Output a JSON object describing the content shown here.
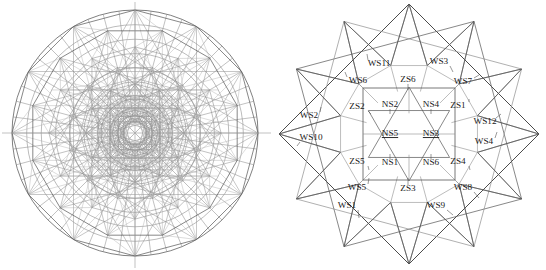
{
  "page": {
    "width": 546,
    "height": 270,
    "background": "#ffffff"
  },
  "colors": {
    "line_dark": "#2b2b2b",
    "line_mid": "#555555",
    "line_light": "#8e8e8e",
    "line_faint": "#b0b0b0",
    "axis": "#a8a8a8",
    "text": "#1a1a1a"
  },
  "left_figure": {
    "name": "polar-mesh-disk",
    "description": "Circular radial mesh with concentric rings, radial spokes, inscribed polygons and triangulation",
    "center": {
      "x": 135,
      "y": 133
    },
    "outer_radius": 123,
    "ring_count": 9,
    "spoke_count": 48,
    "axis_lines": {
      "horizontal": true,
      "vertical": true
    },
    "inscribed_polygon_sides": 12
  },
  "right_figure": {
    "name": "twelve-point-star-diagram",
    "description": "Twelve-pointed star polygon built from overlapping squares with an inner square containing a hexagram; regions labelled WS, ZS and NS",
    "center": {
      "x": 136,
      "y": 134
    },
    "outer_radius": 130,
    "star_points": 12,
    "inner_square_half": 46,
    "labels": {
      "ws": [
        {
          "text": "WS1",
          "x": 74,
          "y": 206,
          "leader": {
            "x2": 86,
            "y2": 218
          }
        },
        {
          "text": "WS2",
          "x": 36,
          "y": 116,
          "leader": {
            "x2": 48,
            "y2": 107
          }
        },
        {
          "text": "WS3",
          "x": 166,
          "y": 62,
          "leader": {
            "x2": 180,
            "y2": 72
          }
        },
        {
          "text": "WS4",
          "x": 211,
          "y": 142,
          "leader": {
            "x2": 224,
            "y2": 132
          }
        },
        {
          "text": "WS5",
          "x": 84,
          "y": 188,
          "leader": {
            "x2": 96,
            "y2": 178
          }
        },
        {
          "text": "WS6",
          "x": 85,
          "y": 81,
          "leader": {
            "x2": 72,
            "y2": 72
          }
        },
        {
          "text": "WS7",
          "x": 190,
          "y": 82,
          "leader": {
            "x2": 206,
            "y2": 75
          }
        },
        {
          "text": "WS8",
          "x": 190,
          "y": 188,
          "leader": {
            "x2": 206,
            "y2": 198
          }
        },
        {
          "text": "WS9",
          "x": 163,
          "y": 206,
          "leader": {
            "x2": 180,
            "y2": 215
          }
        },
        {
          "text": "WS10",
          "x": 38,
          "y": 138,
          "leader": {
            "x2": 24,
            "y2": 146
          }
        },
        {
          "text": "WS11",
          "x": 106,
          "y": 64,
          "leader": {
            "x2": 94,
            "y2": 54
          }
        },
        {
          "text": "WS12",
          "x": 212,
          "y": 122,
          "leader": {
            "x2": 228,
            "y2": 114
          }
        }
      ],
      "zs": [
        {
          "text": "ZS1",
          "x": 185,
          "y": 106,
          "leader": {
            "x2": 196,
            "y2": 99
          }
        },
        {
          "text": "ZS2",
          "x": 84,
          "y": 107,
          "leader": {
            "x2": 98,
            "y2": 114
          }
        },
        {
          "text": "ZS3",
          "x": 135,
          "y": 189,
          "leader": {
            "x2": 135,
            "y2": 178
          }
        },
        {
          "text": "ZS4",
          "x": 185,
          "y": 162,
          "leader": {
            "x2": 197,
            "y2": 170
          }
        },
        {
          "text": "ZS5",
          "x": 84,
          "y": 162,
          "leader": {
            "x2": 96,
            "y2": 170
          }
        },
        {
          "text": "ZS6",
          "x": 135,
          "y": 80,
          "leader": {
            "x2": 135,
            "y2": 90
          }
        }
      ],
      "ns": [
        {
          "text": "NS1",
          "x": 117,
          "y": 163,
          "underline": false,
          "leader": {
            "x2": 117,
            "y2": 154
          }
        },
        {
          "text": "NS2",
          "x": 117,
          "y": 105,
          "underline": false,
          "leader": {
            "x2": 117,
            "y2": 114
          }
        },
        {
          "text": "NS3",
          "x": 158,
          "y": 134,
          "underline": true,
          "leader": null
        },
        {
          "text": "NS4",
          "x": 158,
          "y": 105,
          "underline": false,
          "leader": {
            "x2": 158,
            "y2": 114
          }
        },
        {
          "text": "NS5",
          "x": 117,
          "y": 134,
          "underline": true,
          "leader": null
        },
        {
          "text": "NS6",
          "x": 158,
          "y": 163,
          "underline": false,
          "leader": {
            "x2": 158,
            "y2": 154
          }
        }
      ]
    }
  }
}
